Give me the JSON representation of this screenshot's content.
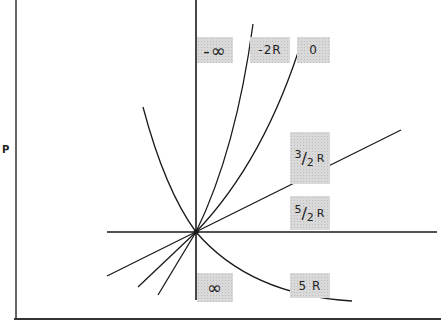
{
  "diagram": {
    "type": "polytropic-process-curves",
    "axis": {
      "y_label": "P",
      "x_label": ""
    },
    "labels": {
      "neg_infinity": "-∞",
      "neg_two_r": "-2R",
      "zero": "0",
      "three_half_r": {
        "num": "3",
        "den": "2",
        "unit": "R"
      },
      "five_half_r": {
        "num": "5",
        "den": "2",
        "unit": "R"
      },
      "infinity": "∞",
      "five_r": "5 R"
    },
    "colors": {
      "line": "#1a1a1a",
      "label_bg": "#d9d9d9",
      "background": "#ffffff"
    }
  }
}
